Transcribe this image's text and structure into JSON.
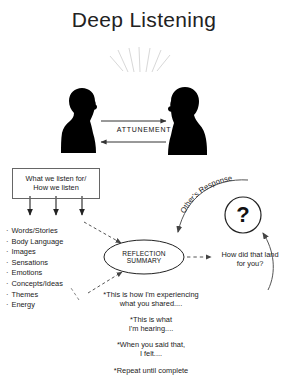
{
  "title": "Deep Listening",
  "diagram": {
    "attunement_label": "ATTUNEMENT",
    "left_figure_name": "person-silhouette-left",
    "right_figure_name": "person-silhouette-right",
    "listen_box": {
      "line1": "What we listen for/",
      "line2": "How we listen"
    },
    "listen_for_items": [
      "Words/Stories",
      "Body Language",
      "Images",
      "Sensations",
      "Emotions",
      "Concepts/Ideas",
      "Themes",
      "Energy"
    ],
    "reflection_label": "REFLECTION SUMMARY",
    "others_response_label": "Other's Response",
    "question_mark": "?",
    "land_question": {
      "line1": "How did that land",
      "line2": "for you?"
    },
    "notes": [
      {
        "line1": "*This is how I'm experiencing",
        "line2": "what you shared...."
      },
      {
        "line1": "*This is what",
        "line2": "I'm hearing...."
      },
      {
        "line1": "*When you said that,",
        "line2": "I felt...."
      },
      {
        "line1": "*Repeat until complete",
        "line2": ""
      }
    ]
  },
  "colors": {
    "background": "#ffffff",
    "ink": "#1a1a1a",
    "figure": "#000000",
    "box_border": "#666666",
    "dashed": "#555555",
    "rays": "#d8d8d8"
  }
}
